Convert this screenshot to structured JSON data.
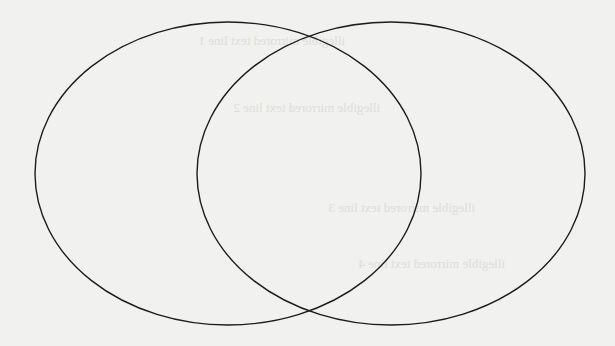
{
  "diagram": {
    "type": "venn",
    "sets": [
      {
        "name": "left-set",
        "label": ""
      },
      {
        "name": "right-set",
        "label": ""
      }
    ],
    "stroke_color": "#1c1c1c",
    "background_color": "#f1f1ef",
    "show_through_text": [
      "illegible mirrored text line 1",
      "illegible mirrored text line 2",
      "illegible mirrored text line 3",
      "illegible mirrored text line 4"
    ]
  }
}
